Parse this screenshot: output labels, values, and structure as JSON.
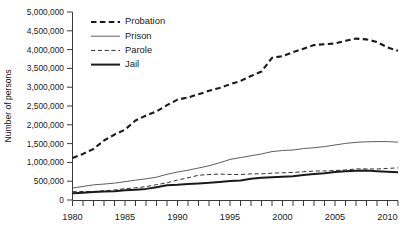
{
  "chart_data": {
    "type": "line",
    "title": "",
    "xlabel": "",
    "ylabel": "Number of persons",
    "xlim": [
      1980,
      2011
    ],
    "ylim": [
      0,
      5000000
    ],
    "grid": false,
    "legend_position": "top-left-inside",
    "y_ticks": [
      0,
      500000,
      1000000,
      1500000,
      2000000,
      2500000,
      3000000,
      3500000,
      4000000,
      4500000,
      5000000
    ],
    "y_tick_labels": [
      "0",
      "500,000",
      "1,000,000",
      "1,500,000",
      "2,000,000",
      "2,500,000",
      "3,000,000",
      "3,500,000",
      "4,000,000",
      "4,500,000",
      "5,000,000"
    ],
    "x_ticks": [
      1980,
      1981,
      1982,
      1983,
      1984,
      1985,
      1986,
      1987,
      1988,
      1989,
      1990,
      1991,
      1992,
      1993,
      1994,
      1995,
      1996,
      1997,
      1998,
      1999,
      2000,
      2001,
      2002,
      2003,
      2004,
      2005,
      2006,
      2007,
      2008,
      2009,
      2010,
      2011
    ],
    "x_tick_labels": [
      "1980",
      "1985",
      "1990",
      "1995",
      "2000",
      "2005",
      "2010"
    ],
    "x_tick_label_values": [
      1980,
      1985,
      1990,
      1995,
      2000,
      2005,
      2010
    ],
    "x": [
      1980,
      1981,
      1982,
      1983,
      1984,
      1985,
      1986,
      1987,
      1988,
      1989,
      1990,
      1991,
      1992,
      1993,
      1994,
      1995,
      1996,
      1997,
      1998,
      1999,
      2000,
      2001,
      2002,
      2003,
      2004,
      2005,
      2006,
      2007,
      2008,
      2009,
      2010,
      2011
    ],
    "series": [
      {
        "name": "Probation",
        "style": "thick-dashed",
        "color": "#1a1a1a",
        "values": [
          1118097,
          1225934,
          1357264,
          1582947,
          1740948,
          1870132,
          2114621,
          2247158,
          2356483,
          2522125,
          2670234,
          2728472,
          2811611,
          2903061,
          2981022,
          3077861,
          3164996,
          3296513,
          3417613,
          3779922,
          3826209,
          3931731,
          4024067,
          4120012,
          4143792,
          4162536,
          4236800,
          4293163,
          4270917,
          4203967,
          4055514,
          3971070
        ]
      },
      {
        "name": "Prison",
        "style": "thin-solid",
        "color": "#555555",
        "values": [
          319598,
          360029,
          402914,
          423898,
          448264,
          487593,
          526436,
          562814,
          607766,
          683367,
          743382,
          792535,
          850566,
          909381,
          990147,
          1078542,
          1127528,
          1176564,
          1224469,
          1287172,
          1316333,
          1330007,
          1367856,
          1390279,
          1421345,
          1462866,
          1504660,
          1532851,
          1547742,
          1553574,
          1552669,
          1538847
        ]
      },
      {
        "name": "Parole",
        "style": "thin-dashed",
        "color": "#333333",
        "values": [
          220438,
          225539,
          224604,
          246440,
          266992,
          300203,
          325638,
          355505,
          407977,
          456803,
          531407,
          590442,
          658601,
          676100,
          690371,
          679421,
          679733,
          694787,
          696385,
          714457,
          723898,
          732333,
          750934,
          769925,
          771852,
          784408,
          798202,
          826097,
          828169,
          824365,
          840676,
          853852
        ]
      },
      {
        "name": "Jail",
        "style": "thick-solid",
        "color": "#1a1a1a",
        "values": [
          182288,
          195085,
          209582,
          223551,
          234500,
          256615,
          274444,
          295873,
          341893,
          393303,
          405320,
          424129,
          441781,
          455500,
          479800,
          507044,
          518492,
          567079,
          592462,
          605943,
          621149,
          631240,
          665475,
          691301,
          713990,
          747529,
          765819,
          780174,
          785533,
          767434,
          748728,
          735601
        ]
      }
    ],
    "legend": [
      {
        "label": "Probation",
        "style": "thick-dashed"
      },
      {
        "label": "Prison",
        "style": "thin-solid"
      },
      {
        "label": "Parole",
        "style": "thin-dashed"
      },
      {
        "label": "Jail",
        "style": "thick-solid"
      }
    ]
  }
}
